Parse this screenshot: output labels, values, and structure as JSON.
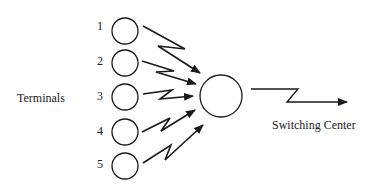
{
  "diagram": {
    "type": "network-topology",
    "left_label": "Terminals",
    "right_label": "Switching Center",
    "terminals": [
      {
        "id": "1",
        "label": "1"
      },
      {
        "id": "2",
        "label": "2"
      },
      {
        "id": "3",
        "label": "3"
      },
      {
        "id": "4",
        "label": "4"
      },
      {
        "id": "5",
        "label": "5"
      }
    ],
    "hub": {
      "label": ""
    },
    "edges": [
      {
        "from": "1",
        "to": "hub",
        "style": "lightning-arrow"
      },
      {
        "from": "2",
        "to": "hub",
        "style": "lightning-arrow"
      },
      {
        "from": "3",
        "to": "hub",
        "style": "lightning-arrow"
      },
      {
        "from": "4",
        "to": "hub",
        "style": "lightning-arrow"
      },
      {
        "from": "5",
        "to": "hub",
        "style": "lightning-arrow"
      },
      {
        "from": "hub",
        "to": "Switching Center",
        "style": "lightning-arrow"
      }
    ],
    "colors": {
      "stroke": "#1a1a1a",
      "background": "#ffffff"
    }
  }
}
